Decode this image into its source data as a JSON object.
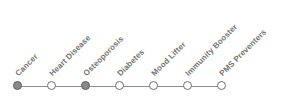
{
  "widget": {
    "name": "health-benefits-stepper",
    "orientation": "horizontal",
    "label_rotation_deg": -45,
    "track_color": "#8e8e8e",
    "node_fill_active": "#8a8a8a",
    "node_fill_inactive": "#ffffff",
    "node_border": "#6e6e6e",
    "label_color": "#737373",
    "background": "#ffffff"
  },
  "steps": [
    {
      "label": "Cancer",
      "state": "filled"
    },
    {
      "label": "Heart Disease",
      "state": "empty"
    },
    {
      "label": "Osteoporosis",
      "state": "filled"
    },
    {
      "label": "Diabetes",
      "state": "empty"
    },
    {
      "label": "Mood Lifter",
      "state": "empty"
    },
    {
      "label": "Immunity Booster",
      "state": "empty"
    },
    {
      "label": "PMS Preventers",
      "state": "empty"
    }
  ]
}
